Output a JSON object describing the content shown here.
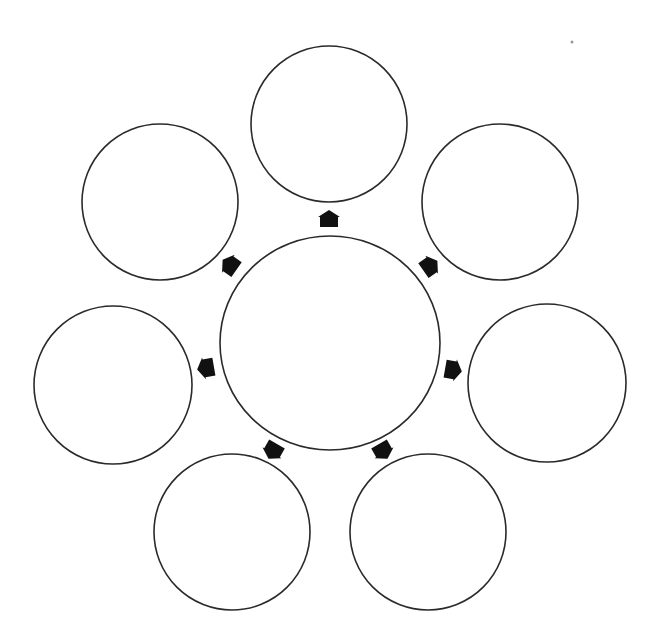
{
  "diagram": {
    "type": "hub-and-spoke",
    "colors": {
      "background": "#ffffff",
      "circle_stroke": "#2a2a2a",
      "circle_fill": "#ffffff",
      "arrow_fill": "#111111"
    },
    "hub": {
      "id": "center",
      "label": "",
      "cx": 330,
      "cy": 343,
      "rx": 110,
      "ry": 107
    },
    "nodes": [
      {
        "id": "top",
        "label": "",
        "cx": 329,
        "cy": 124,
        "r": 78
      },
      {
        "id": "top-right",
        "label": "",
        "cx": 500,
        "cy": 202,
        "r": 78
      },
      {
        "id": "right",
        "label": "",
        "cx": 547,
        "cy": 383,
        "r": 79
      },
      {
        "id": "bottom-right",
        "label": "",
        "cx": 428,
        "cy": 532,
        "r": 78
      },
      {
        "id": "bottom-left",
        "label": "",
        "cx": 232,
        "cy": 532,
        "r": 78
      },
      {
        "id": "left",
        "label": "",
        "cx": 113,
        "cy": 385,
        "r": 79
      },
      {
        "id": "top-left",
        "label": "",
        "cx": 160,
        "cy": 202,
        "r": 78
      }
    ],
    "arrows": [
      {
        "id": "arrow-top",
        "x": 329,
        "y": 219,
        "rotate": 0
      },
      {
        "id": "arrow-top-right",
        "x": 430,
        "y": 266,
        "rotate": 55
      },
      {
        "id": "arrow-right",
        "x": 453,
        "y": 370,
        "rotate": 100
      },
      {
        "id": "arrow-bottom-right",
        "x": 383,
        "y": 451,
        "rotate": 150
      },
      {
        "id": "arrow-bottom-left",
        "x": 273,
        "y": 451,
        "rotate": -150
      },
      {
        "id": "arrow-left",
        "x": 206,
        "y": 368,
        "rotate": -100
      },
      {
        "id": "arrow-top-left",
        "x": 230,
        "y": 265,
        "rotate": -55
      }
    ]
  }
}
